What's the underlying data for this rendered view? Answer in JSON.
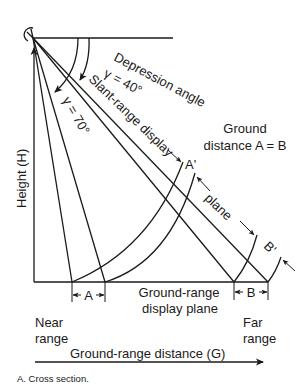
{
  "figure": {
    "caption": "A.  Cross section.",
    "labels": {
      "depression_angle": "Depression angle",
      "gamma_far": "γ = 40°",
      "gamma_near": "γ = 70°",
      "slant_range_display": "Slant-range display",
      "plane": "plane",
      "ground_line1": "Ground",
      "ground_line2": "distance A = B",
      "a_prime": "A'",
      "b_prime": "B'",
      "height_axis": "Height (H)",
      "segment_a": "A",
      "segment_b": "B",
      "ground_range_plane_line1": "Ground-range",
      "ground_range_plane_line2": "display plane",
      "near_line1": "Near",
      "near_line2": "range",
      "far_line1": "Far",
      "far_line2": "range",
      "ground_range_distance": "Ground-range distance (G)"
    },
    "angles": {
      "near_depression_deg": 70,
      "far_depression_deg": 40
    },
    "colors": {
      "ink": "#1a1a1a",
      "background": "#ffffff"
    }
  }
}
